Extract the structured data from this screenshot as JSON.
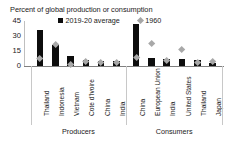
{
  "chart_data": {
    "type": "bar",
    "title": "Percent of global production or consumption",
    "xlabel": "",
    "ylabel": "",
    "ylim": [
      0,
      45
    ],
    "yticks": [
      "0",
      "15",
      "30",
      "45"
    ],
    "grid": false,
    "legend_position": "top",
    "categories": [
      "Thailand",
      "Indonesia",
      "Vietnam",
      "Cote d'Ivoire",
      "China",
      "India",
      "China",
      "European Union",
      "India",
      "United States",
      "Thailand",
      "Japan"
    ],
    "groups": [
      {
        "label": "Producers",
        "categories": [
          "Thailand",
          "Indonesia",
          "Vietnam",
          "Cote d'Ivoire",
          "China",
          "India"
        ]
      },
      {
        "label": "Consumers",
        "categories": [
          "China",
          "European Union",
          "India",
          "United States",
          "Thailand",
          "Japan"
        ]
      }
    ],
    "series": [
      {
        "name": "2019-20 average",
        "marker": "square",
        "color": "#0d0d0d",
        "values": [
          36,
          21,
          10,
          6,
          5,
          5,
          42,
          8,
          7,
          7,
          6,
          3
        ]
      },
      {
        "name": "1960",
        "marker": "diamond",
        "color": "#a8a8a8",
        "values": [
          7,
          21,
          1,
          4,
          3,
          3,
          8,
          22,
          5,
          16,
          3,
          4
        ]
      }
    ]
  },
  "legend": {
    "entries": [
      {
        "label": "2019-20 average",
        "marker": "square-marker"
      },
      {
        "label": "1960",
        "marker": "diamond-marker"
      }
    ]
  },
  "colors": {
    "bar": "#0d0d0d",
    "marker": "#a8a8a8",
    "axis": "#808080",
    "text": "#1a1a1a",
    "background": "#ffffff"
  }
}
